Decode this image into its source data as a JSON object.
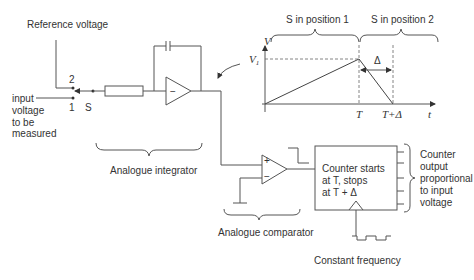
{
  "diagram": {
    "labels": {
      "reference_voltage": "Reference voltage",
      "input_voltage": [
        "input",
        "voltage",
        "to be",
        "measured"
      ],
      "switch_pos2": "2",
      "switch_pos1": "1",
      "switch_name": "S",
      "integrator": "Analogue integrator",
      "comparator": "Analogue comparator",
      "comparator_plus": "+",
      "comparator_minus": "−",
      "integrator_minus": "−",
      "counter_text": [
        "Counter starts",
        "at T, stops",
        "at T + Δ"
      ],
      "counter_output": [
        "Counter",
        "output",
        "proportional",
        "to input",
        "voltage"
      ],
      "clock": "Constant frequency"
    },
    "graph": {
      "phase1": "S in position 1",
      "phase2": "S in position 2",
      "y_axis": "V",
      "v_level": "V",
      "v_level_sub": "1",
      "x_T": "T",
      "x_T_delta": "T+Δ",
      "x_axis": "t",
      "delta": "Δ"
    }
  }
}
